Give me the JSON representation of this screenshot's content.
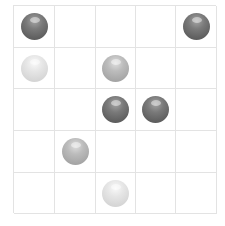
{
  "board": {
    "rows": 5,
    "cols": 5,
    "grid_line_color": "#e3e3e3",
    "ball_colors": {
      "dark": "#6e6e6e",
      "medium": "#b5b5b5",
      "light": "#e0e0e0"
    },
    "cells": [
      [
        "dark",
        null,
        null,
        null,
        "dark"
      ],
      [
        "light",
        null,
        "medium",
        null,
        null
      ],
      [
        null,
        null,
        "dark",
        "dark",
        null
      ],
      [
        null,
        "medium",
        null,
        null,
        null
      ],
      [
        null,
        null,
        "light",
        null,
        null
      ]
    ]
  }
}
